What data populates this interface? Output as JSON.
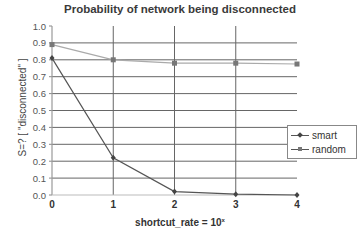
{
  "chart_data": {
    "type": "line",
    "title": "Probability of network being disconnected",
    "xlabel": "shortcut_rate = 10",
    "xlabel_superscript": "x",
    "ylabel": "S=? [ \"disconnected\" ]",
    "x": [
      0,
      1,
      2,
      3,
      4
    ],
    "x_tick_labels": [
      "0",
      "1",
      "2",
      "3",
      "4"
    ],
    "y_tick_labels": [
      "0.0",
      "0.1",
      "0.2",
      "0.3",
      "0.4",
      "0.5",
      "0.6",
      "0.7",
      "0.8",
      "0.9",
      "1.0"
    ],
    "ylim": [
      0,
      1.0
    ],
    "xlim": [
      0,
      4
    ],
    "grid": true,
    "legend_position": "right",
    "series": [
      {
        "name": "smart",
        "marker": "diamond",
        "color": "#555555",
        "values": [
          0.81,
          0.22,
          0.02,
          0.005,
          0.0
        ]
      },
      {
        "name": "random",
        "marker": "square",
        "color": "#777777",
        "values": [
          0.89,
          0.8,
          0.78,
          0.78,
          0.775
        ]
      }
    ]
  },
  "legend": {
    "items": [
      {
        "label": "smart"
      },
      {
        "label": "random"
      }
    ]
  }
}
